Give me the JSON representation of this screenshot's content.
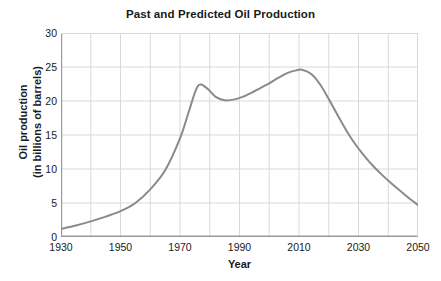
{
  "chart_data": {
    "type": "line",
    "title": "Past and Predicted Oil Production",
    "xlabel": "Year",
    "ylabel_line1": "Oil production",
    "ylabel_line2": "(in billions of barrels)",
    "ylabel": "Oil production (in billions of barrels)",
    "xlim": [
      1930,
      2050
    ],
    "ylim": [
      0,
      30
    ],
    "xticks": [
      1930,
      1950,
      1970,
      1990,
      2010,
      2030,
      2050
    ],
    "xtick_labels": [
      "1930",
      "1950",
      "1970",
      "1990",
      "2010",
      "2030",
      "2050"
    ],
    "yticks": [
      0,
      5,
      10,
      15,
      20,
      25,
      30
    ],
    "ytick_labels": [
      "0",
      "5",
      "10",
      "15",
      "20",
      "25",
      "30"
    ],
    "grid": true,
    "grid_x_step": 10,
    "grid_y_step": 5,
    "legend": null,
    "series": [
      {
        "name": "Oil production",
        "color": "#8a8a8a",
        "x": [
          1930,
          1935,
          1940,
          1945,
          1950,
          1955,
          1960,
          1965,
          1970,
          1973,
          1976,
          1979,
          1982,
          1985,
          1988,
          1991,
          1994,
          1997,
          2000,
          2003,
          2006,
          2009,
          2011,
          2014,
          2017,
          2020,
          2023,
          2026,
          2029,
          2032,
          2035,
          2038,
          2041,
          2044,
          2047,
          2050
        ],
        "y": [
          1.2,
          1.7,
          2.3,
          3.0,
          3.8,
          5.0,
          7.0,
          9.8,
          14.5,
          18.5,
          22.2,
          21.9,
          20.6,
          20.1,
          20.2,
          20.6,
          21.2,
          21.9,
          22.6,
          23.4,
          24.1,
          24.5,
          24.6,
          24.0,
          22.5,
          20.3,
          17.9,
          15.6,
          13.6,
          11.9,
          10.4,
          9.1,
          7.9,
          6.8,
          5.7,
          4.7
        ]
      }
    ],
    "annotations": {
      "first_peak_year": 1976,
      "first_peak_value": 22.2,
      "local_min_year": 1985,
      "local_min_value": 20.1,
      "max_year": 2011,
      "max_value": 24.6,
      "start_value": 1.2,
      "end_value": 4.7
    }
  },
  "colors": {
    "curve": "#8a8a8a",
    "grid": "#d9d9d9",
    "axis": "#9a9a9a",
    "text": "#1a1a1a",
    "background": "#ffffff"
  }
}
